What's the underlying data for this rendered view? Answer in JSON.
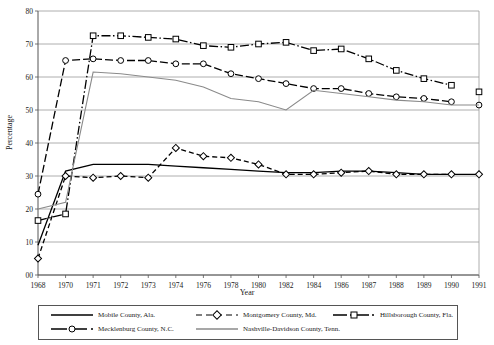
{
  "chart_data": {
    "type": "line",
    "title": "",
    "subtitle": "",
    "xlabel": "Year",
    "ylabel": "Percentage",
    "ylim": [
      0,
      80
    ],
    "ytick_labels": [
      "00",
      "10",
      "20",
      "30",
      "40",
      "50",
      "60",
      "70",
      "80"
    ],
    "ytick_values": [
      0,
      10,
      20,
      30,
      40,
      50,
      60,
      70,
      80
    ],
    "grid": "horizontal",
    "legend_position": "bottom",
    "categories": [
      1968,
      1970,
      1971,
      1972,
      1973,
      1974,
      1976,
      1978,
      1980,
      1982,
      1984,
      1986,
      1987,
      1988,
      1989,
      1990,
      1991
    ],
    "tick_labels": [
      "1968",
      "1970",
      "1971",
      "1972",
      "1973",
      "1974",
      "1976",
      "1978",
      "1980",
      "1982",
      "1984",
      "1986",
      "1987",
      "1988",
      "1989",
      "1990",
      "1991"
    ],
    "series": [
      {
        "name": "Mobile County, Ala.",
        "style": "solid",
        "marker": "none",
        "color": "#000000",
        "values": [
          9,
          31.5,
          33.5,
          33.5,
          33.5,
          33,
          32.5,
          32,
          31.5,
          31,
          31,
          31.5,
          31.5,
          31,
          30.5,
          30.5,
          30.5
        ]
      },
      {
        "name": "Montgomery County, Md.",
        "style": "dashed",
        "marker": "diamond",
        "color": "#000000",
        "values": [
          5,
          30,
          29.5,
          30,
          29.5,
          38.5,
          36,
          35.5,
          33.5,
          30.5,
          30.5,
          31,
          31.5,
          30.5,
          30.5,
          30.5,
          30.5
        ]
      },
      {
        "name": "Hillsborough County, Fla.",
        "style": "dash-dot",
        "marker": "square",
        "color": "#000000",
        "values": [
          16.5,
          18.5,
          72.5,
          72.5,
          72,
          71.5,
          69.5,
          69,
          70,
          70.5,
          68,
          68.5,
          65.5,
          62,
          59.5,
          57.5,
          55.5
        ]
      },
      {
        "name": "Mecklenburg County, N.C.",
        "style": "long-dash",
        "marker": "circle",
        "color": "#000000",
        "values": [
          24.5,
          65,
          65.5,
          65,
          65,
          64,
          64,
          61,
          59.5,
          58,
          56.5,
          56.5,
          55,
          54,
          53.5,
          52.5,
          51.5
        ]
      },
      {
        "name": "Nashville-Davidson County, Tenn.",
        "style": "solid",
        "marker": "none",
        "color": "#8a8a8a",
        "values": [
          20,
          22,
          61.5,
          61,
          60,
          59,
          57,
          53.5,
          52.5,
          50,
          56,
          55,
          54,
          53,
          52.5,
          51.5,
          51.5
        ]
      }
    ]
  },
  "axis": {
    "x_title": "Year",
    "y_title": "Percentage"
  },
  "legend": {
    "items": [
      {
        "label": "Mobile County, Ala."
      },
      {
        "label": "Montgomery County, Md."
      },
      {
        "label": "Hillsborough County, Fla."
      },
      {
        "label": "Mecklenburg County, N.C."
      },
      {
        "label": "Nashville-Davidson County, Tenn."
      }
    ]
  }
}
